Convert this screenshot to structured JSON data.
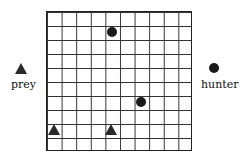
{
  "grid": {
    "rows": 10,
    "cols": 10
  },
  "hunters": [
    {
      "row": 1,
      "col": 4
    },
    {
      "row": 6,
      "col": 6
    }
  ],
  "prey": [
    {
      "row": 8,
      "col": 0
    },
    {
      "row": 8,
      "col": 4
    }
  ],
  "legend": {
    "prey_label": "prey",
    "hunter_label": "hunter"
  }
}
